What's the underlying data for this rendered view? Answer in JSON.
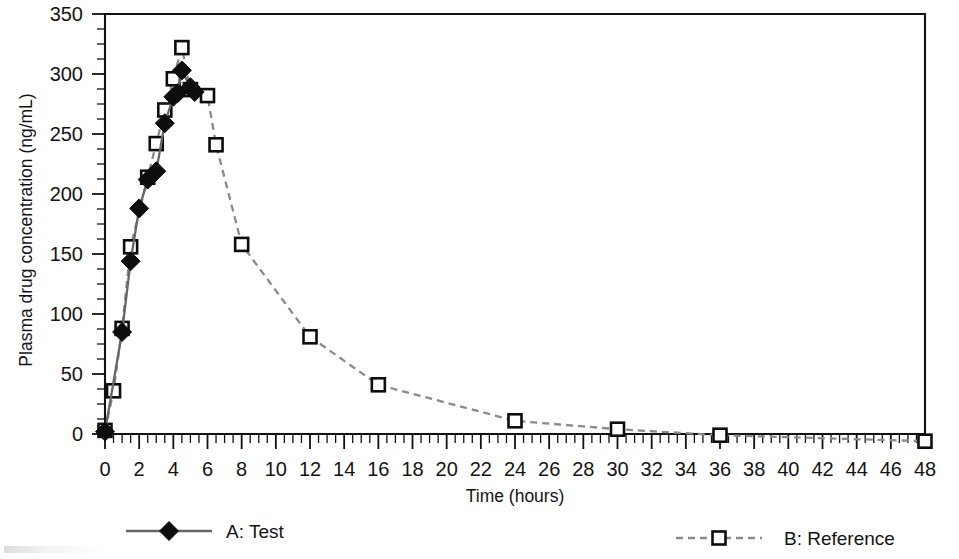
{
  "chart_data": {
    "type": "line",
    "title": "",
    "xlabel": "Time (hours)",
    "ylabel": "Plasma drug concentration (ng/mL)",
    "xlim": [
      0,
      48
    ],
    "ylim": [
      0,
      350
    ],
    "x_ticks": [
      0,
      2,
      4,
      6,
      8,
      10,
      12,
      14,
      16,
      18,
      20,
      22,
      24,
      26,
      28,
      30,
      32,
      34,
      36,
      38,
      40,
      42,
      44,
      46,
      48
    ],
    "y_ticks": [
      0,
      50,
      100,
      150,
      200,
      250,
      300,
      350
    ],
    "x_minor_tick_interval": 0.5,
    "y_minor_tick_interval": 12.5,
    "grid": false,
    "legend_position": "bottom",
    "series": [
      {
        "name": "A: Test",
        "marker": "filled-diamond",
        "linestyle": "solid",
        "color": "#666666",
        "marker_color": "#0d0d0d",
        "points": [
          {
            "x": 0,
            "y": 2
          },
          {
            "x": 1,
            "y": 85
          },
          {
            "x": 1.5,
            "y": 144
          },
          {
            "x": 2,
            "y": 188
          },
          {
            "x": 2.5,
            "y": 212
          },
          {
            "x": 3,
            "y": 219
          },
          {
            "x": 3.5,
            "y": 259
          },
          {
            "x": 4,
            "y": 281
          },
          {
            "x": 4.25,
            "y": 284
          },
          {
            "x": 4.5,
            "y": 303
          },
          {
            "x": 5,
            "y": 289
          },
          {
            "x": 5.25,
            "y": 285
          }
        ]
      },
      {
        "name": "B: Reference",
        "marker": "open-square",
        "linestyle": "dashed",
        "color": "#8a8a8a",
        "marker_color": "#0d0d0d",
        "points": [
          {
            "x": 0,
            "y": 3
          },
          {
            "x": 0.5,
            "y": 36
          },
          {
            "x": 1,
            "y": 88
          },
          {
            "x": 1.5,
            "y": 156
          },
          {
            "x": 2.5,
            "y": 214
          },
          {
            "x": 3,
            "y": 242
          },
          {
            "x": 3.5,
            "y": 270
          },
          {
            "x": 4,
            "y": 296
          },
          {
            "x": 4.5,
            "y": 322
          },
          {
            "x": 5,
            "y": 287
          },
          {
            "x": 6,
            "y": 282
          },
          {
            "x": 6.5,
            "y": 241
          },
          {
            "x": 8,
            "y": 158
          },
          {
            "x": 12,
            "y": 81
          },
          {
            "x": 16,
            "y": 41
          },
          {
            "x": 24,
            "y": 11
          },
          {
            "x": 30,
            "y": 4
          },
          {
            "x": 36,
            "y": -1
          },
          {
            "x": 48,
            "y": -6
          }
        ]
      }
    ]
  },
  "legend": {
    "items": [
      {
        "label": "A: Test",
        "marker": "filled-diamond",
        "linestyle": "solid"
      },
      {
        "label": "B: Reference",
        "marker": "open-square",
        "linestyle": "dashed"
      }
    ]
  }
}
